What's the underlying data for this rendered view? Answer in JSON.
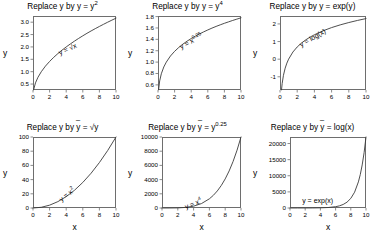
{
  "figure": {
    "rows": 2,
    "cols": 3,
    "axis_label_x": "x",
    "axis_label_y": "y"
  },
  "chart_data": [
    {
      "id": "panel-1",
      "type": "line",
      "title_prefix": "Replace y by ",
      "title_var": "y",
      "title_eq": " = y",
      "title_exp": "2",
      "title_text": "Replace y by y~ = y2",
      "curve_label": "y = √x",
      "curve_label_rotation": -25,
      "function": "sqrt",
      "xlabel": "",
      "ylabel": "y",
      "xlim": [
        0,
        10
      ],
      "ylim": [
        0.26,
        3.25
      ],
      "xticks": [
        0,
        2,
        4,
        6,
        8,
        10
      ],
      "yticks": [
        0.5,
        1.0,
        1.5,
        2.0,
        2.5,
        3.0
      ],
      "ytick_labels": [
        "0.5",
        "1.0",
        "1.5",
        "2.0",
        "2.5",
        "3.0"
      ],
      "x": [
        0.07,
        0.3,
        0.6,
        1,
        1.5,
        2,
        2.5,
        3,
        3.5,
        4,
        4.5,
        5,
        5.5,
        6,
        6.5,
        7,
        7.5,
        8,
        8.5,
        9,
        9.5,
        10
      ],
      "y": [
        0.265,
        0.548,
        0.775,
        1.0,
        1.225,
        1.414,
        1.581,
        1.732,
        1.871,
        2.0,
        2.121,
        2.236,
        2.345,
        2.449,
        2.55,
        2.646,
        2.739,
        2.828,
        2.915,
        3.0,
        3.082,
        3.162
      ]
    },
    {
      "id": "panel-2",
      "type": "line",
      "title_prefix": "Replace y by ",
      "title_var": "y",
      "title_eq": " = y",
      "title_exp": "4",
      "title_text": "Replace y by y~ = y4",
      "curve_label": "y = x",
      "curve_label_exp": "0.25",
      "curve_label_rotation": -28,
      "function": "x^0.25",
      "xlabel": "",
      "ylabel": "y",
      "xlim": [
        0,
        10
      ],
      "ylim": [
        0.51,
        1.81
      ],
      "xticks": [
        0,
        2,
        4,
        6,
        8,
        10
      ],
      "yticks": [
        0.6,
        0.8,
        1.0,
        1.2,
        1.4,
        1.6,
        1.8
      ],
      "ytick_labels": [
        "0.6",
        "0.8",
        "1.0",
        "1.2",
        "1.4",
        "1.6",
        "1.8"
      ],
      "x": [
        0.07,
        0.2,
        0.4,
        0.7,
        1,
        1.5,
        2,
        2.5,
        3,
        3.5,
        4,
        4.5,
        5,
        5.5,
        6,
        6.5,
        7,
        7.5,
        8,
        8.5,
        9,
        9.5,
        10
      ],
      "y": [
        0.514,
        0.669,
        0.795,
        0.915,
        1.0,
        1.107,
        1.189,
        1.257,
        1.316,
        1.368,
        1.414,
        1.456,
        1.495,
        1.531,
        1.565,
        1.597,
        1.627,
        1.655,
        1.682,
        1.707,
        1.732,
        1.755,
        1.778
      ]
    },
    {
      "id": "panel-3",
      "type": "line",
      "title_prefix": "Replace y by ",
      "title_var": "y",
      "title_eq": " = exp(y)",
      "title_exp": "",
      "title_text": "Replace y by y~ = exp(y)",
      "curve_label": "y = log(x)",
      "curve_label_rotation": -30,
      "function": "log",
      "xlabel": "",
      "ylabel": "y",
      "xlim": [
        0,
        10
      ],
      "ylim": [
        -1.75,
        2.45
      ],
      "xticks": [
        0,
        2,
        4,
        6,
        8,
        10
      ],
      "yticks": [
        -1,
        0,
        1,
        2
      ],
      "ytick_labels": [
        "-1",
        "0",
        "1",
        "2"
      ],
      "x": [
        0.175,
        0.25,
        0.4,
        0.6,
        0.8,
        1,
        1.5,
        2,
        2.5,
        3,
        3.5,
        4,
        5,
        6,
        7,
        8,
        9,
        10
      ],
      "y": [
        -1.743,
        -1.386,
        -0.916,
        -0.511,
        -0.223,
        0.0,
        0.405,
        0.693,
        0.916,
        1.099,
        1.253,
        1.386,
        1.609,
        1.792,
        1.946,
        2.079,
        2.197,
        2.303
      ]
    },
    {
      "id": "panel-4",
      "type": "line",
      "title_prefix": "Replace y by ",
      "title_var": "y",
      "title_eq": " = √y",
      "title_exp": "",
      "title_text": "Replace y by y~ = √y",
      "curve_label": "y = x",
      "curve_label_exp": "2",
      "curve_label_rotation": -38,
      "function": "x^2",
      "xlabel": "x",
      "ylabel": "y",
      "xlim": [
        0,
        10
      ],
      "ylim": [
        0,
        100
      ],
      "xticks": [
        0,
        2,
        4,
        6,
        8,
        10
      ],
      "yticks": [
        0,
        20,
        40,
        60,
        80,
        100
      ],
      "ytick_labels": [
        "0",
        "20",
        "40",
        "60",
        "80",
        "100"
      ],
      "x": [
        0,
        1,
        2,
        3,
        4,
        5,
        6,
        7,
        8,
        9,
        10
      ],
      "y": [
        0,
        1,
        4,
        9,
        16,
        25,
        36,
        49,
        64,
        81,
        100
      ]
    },
    {
      "id": "panel-5",
      "type": "line",
      "title_prefix": "Replace y by ",
      "title_var": "y",
      "title_eq": " = y",
      "title_exp": "0.25",
      "title_text": "Replace y by y~ = y0.25",
      "curve_label": "y = x",
      "curve_label_exp": "4",
      "curve_label_rotation": -22,
      "function": "x^4",
      "xlabel": "x",
      "ylabel": "y",
      "xlim": [
        0,
        10
      ],
      "ylim": [
        0,
        10000
      ],
      "xticks": [
        0,
        2,
        4,
        6,
        8,
        10
      ],
      "yticks": [
        0,
        2000,
        4000,
        6000,
        8000,
        10000
      ],
      "ytick_labels": [
        "0",
        "2000",
        "4000",
        "6000",
        "8000",
        "10000"
      ],
      "x": [
        0,
        1,
        2,
        3,
        4,
        5,
        6,
        6.5,
        7,
        7.5,
        8,
        8.5,
        9,
        9.5,
        10
      ],
      "y": [
        0,
        1,
        16,
        81,
        256,
        625,
        1296,
        1785,
        2401,
        3164,
        4096,
        5220,
        6561,
        8145,
        10000
      ]
    },
    {
      "id": "panel-6",
      "type": "line",
      "title_prefix": "Replace y by ",
      "title_var": "y",
      "title_eq": " = log(x)",
      "title_exp": "",
      "title_text": "Replace y by y~ = log(x)",
      "curve_label": "y = exp(x)",
      "curve_label_rotation": 0,
      "function": "exp",
      "xlabel": "x",
      "ylabel": "y",
      "xlim": [
        0,
        10
      ],
      "ylim": [
        0,
        22026
      ],
      "xticks": [
        0,
        2,
        4,
        6,
        8,
        10
      ],
      "yticks": [
        0,
        5000,
        10000,
        15000,
        20000
      ],
      "ytick_labels": [
        "0",
        "5000",
        "10000",
        "15000",
        "20000"
      ],
      "x": [
        0,
        1,
        2,
        3,
        4,
        5,
        6,
        6.5,
        7,
        7.5,
        8,
        8.5,
        9,
        9.25,
        9.5,
        9.75,
        10
      ],
      "y": [
        1,
        2.7,
        7.4,
        20,
        55,
        148,
        403,
        665,
        1097,
        1808,
        2981,
        4915,
        8103,
        10405,
        13360,
        17154,
        22026
      ]
    }
  ],
  "colors": {
    "background": "#ffffff",
    "curve": "#3a3a3a",
    "box": "#6e6e6e",
    "text": "#000000"
  }
}
